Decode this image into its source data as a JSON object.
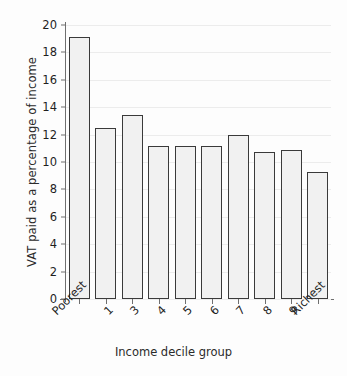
{
  "chart_data": {
    "type": "bar",
    "title": "",
    "xlabel": "Income decile group",
    "ylabel": "VAT paid as a percentage of income",
    "categories": [
      "Poorest",
      "1",
      "3",
      "4",
      "5",
      "6",
      "7",
      "8",
      "9",
      "Richest"
    ],
    "values": [
      19.1,
      12.5,
      13.4,
      11.2,
      11.2,
      11.2,
      12.0,
      10.7,
      10.9,
      9.3
    ],
    "ylim": [
      0,
      20
    ],
    "yticks": [
      0,
      2,
      4,
      6,
      8,
      10,
      12,
      14,
      16,
      18,
      20
    ],
    "ytick_labels": [
      "0",
      "2",
      "4",
      "6",
      "8",
      "10",
      "12",
      "14",
      "16",
      "18",
      "20"
    ],
    "grid": true,
    "grid_axis": "y",
    "legend": null,
    "bar_fill_color": "#f1f1f1",
    "bar_edge_color": "#3a3a3a",
    "axis_color": "#6f6f6f",
    "gridline_color": "#ececec",
    "background_color": "#fdfdfd",
    "text_color": "#1f1f1f",
    "xtick_label_rotation": -45
  }
}
